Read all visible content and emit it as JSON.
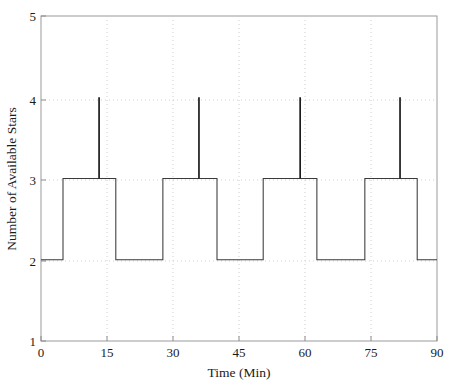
{
  "figure": {
    "background_color": "#ffffff",
    "line_color": "#3a3a3a",
    "spike_color": "#1c1c1c",
    "grid_color": "#c9c9c9",
    "axis_color": "#9a9a9a"
  },
  "axes": {
    "x_title": "Time (Min)",
    "y_title": "Number of Available Stars",
    "x_ticks": [
      "0",
      "15",
      "30",
      "45",
      "60",
      "75",
      "90"
    ],
    "y_ticks": [
      "1",
      "2",
      "3",
      "4",
      "5"
    ]
  },
  "chart_data": {
    "type": "line",
    "title": "",
    "xlabel": "Time (Min)",
    "ylabel": "Number of Available Stars",
    "xlim": [
      0,
      90
    ],
    "ylim": [
      1,
      5
    ],
    "xticks": [
      0,
      15,
      30,
      45,
      60,
      75,
      90
    ],
    "yticks": [
      1,
      2,
      3,
      4,
      5
    ],
    "grid": true,
    "legend": null,
    "drawstyle": "steps-post",
    "series": [
      {
        "name": "Number of Available Stars",
        "x": [
          0,
          5.0,
          5.0,
          13.2,
          13.2,
          13.2,
          17.0,
          17.0,
          27.7,
          27.7,
          35.9,
          35.9,
          35.9,
          40.0,
          40.0,
          50.5,
          50.5,
          58.9,
          58.9,
          58.9,
          62.7,
          62.7,
          73.6,
          73.6,
          81.6,
          81.6,
          81.6,
          85.5,
          85.5,
          90
        ],
        "y": [
          2,
          2,
          3,
          3,
          4,
          3,
          3,
          2,
          2,
          3,
          3,
          4,
          3,
          3,
          2,
          2,
          3,
          3,
          4,
          3,
          3,
          2,
          2,
          3,
          3,
          4,
          3,
          3,
          2,
          2
        ]
      }
    ],
    "step_segments": [
      {
        "start": 0.0,
        "end": 5.0,
        "value": 2
      },
      {
        "start": 5.0,
        "end": 17.0,
        "value": 3
      },
      {
        "start": 17.0,
        "end": 27.7,
        "value": 2
      },
      {
        "start": 27.7,
        "end": 40.0,
        "value": 3
      },
      {
        "start": 40.0,
        "end": 50.5,
        "value": 2
      },
      {
        "start": 50.5,
        "end": 62.7,
        "value": 3
      },
      {
        "start": 62.7,
        "end": 73.6,
        "value": 2
      },
      {
        "start": 73.6,
        "end": 85.5,
        "value": 3
      },
      {
        "start": 85.5,
        "end": 90.0,
        "value": 2
      }
    ],
    "spikes": [
      {
        "x": 13.2,
        "from": 3,
        "to": 4
      },
      {
        "x": 35.9,
        "from": 3,
        "to": 4
      },
      {
        "x": 58.9,
        "from": 3,
        "to": 4
      },
      {
        "x": 81.6,
        "from": 3,
        "to": 4
      }
    ]
  }
}
